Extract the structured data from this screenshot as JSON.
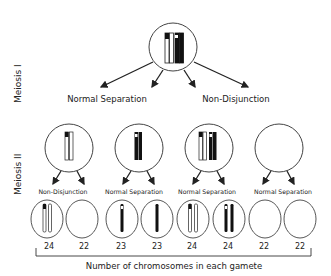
{
  "stages": {
    "meiosis1": "Meiosis I",
    "meiosis2": "Meiosis II"
  },
  "meiosis1_outcomes": {
    "left": "Normal Separation",
    "right": "Non-Disjunction"
  },
  "meiosis2_outcomes": [
    "Non-Disjunction",
    "Normal Separation",
    "Normal Separation",
    "Normal Separation"
  ],
  "gamete_counts": [
    "24",
    "22",
    "23",
    "23",
    "24",
    "24",
    "22",
    "22"
  ],
  "axis_label": "Number of chromosomes in each gamete",
  "colors": {
    "stroke": "#333333",
    "dark_chromosome": "#111111",
    "light_chromosome": "#ffffff"
  }
}
